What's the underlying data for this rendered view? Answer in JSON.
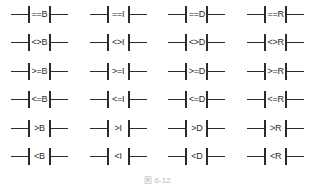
{
  "figure": {
    "caption": "图 6-12",
    "caption_visible": "partially clipped at bottom edge",
    "line_color": "#2b2b2b",
    "background_color": "#ffffff",
    "text_color": "#2b2b2b",
    "caption_color": "#b9b9b9"
  },
  "grid": {
    "columns": 4,
    "rows": 6,
    "column_suffixes": [
      "B",
      "I",
      "D",
      "R"
    ],
    "row_operators": [
      "==",
      "<>",
      ">=",
      "<=",
      ">",
      "<"
    ],
    "cells": [
      {
        "operator": "==",
        "suffix": "B",
        "label": "==B"
      },
      {
        "operator": "==",
        "suffix": "I",
        "label": "==I"
      },
      {
        "operator": "==",
        "suffix": "D",
        "label": "==D"
      },
      {
        "operator": "==",
        "suffix": "R",
        "label": "==R"
      },
      {
        "operator": "<>",
        "suffix": "B",
        "label": "<>B"
      },
      {
        "operator": "<>",
        "suffix": "I",
        "label": "<>I"
      },
      {
        "operator": "<>",
        "suffix": "D",
        "label": "<>D"
      },
      {
        "operator": "<>",
        "suffix": "R",
        "label": "<>R"
      },
      {
        "operator": ">=",
        "suffix": "B",
        "label": ">=B"
      },
      {
        "operator": ">=",
        "suffix": "I",
        "label": ">=I"
      },
      {
        "operator": ">=",
        "suffix": "D",
        "label": ">=D"
      },
      {
        "operator": ">=",
        "suffix": "R",
        "label": ">=R"
      },
      {
        "operator": "<=",
        "suffix": "B",
        "label": "<=B"
      },
      {
        "operator": "<=",
        "suffix": "I",
        "label": "<=I"
      },
      {
        "operator": "<=",
        "suffix": "D",
        "label": "<=D"
      },
      {
        "operator": "<=",
        "suffix": "R",
        "label": "<=R"
      },
      {
        "operator": ">",
        "suffix": "B",
        "label": ">B"
      },
      {
        "operator": ">",
        "suffix": "I",
        "label": ">I"
      },
      {
        "operator": ">",
        "suffix": "D",
        "label": ">D"
      },
      {
        "operator": ">",
        "suffix": "R",
        "label": ">R"
      },
      {
        "operator": "<",
        "suffix": "B",
        "label": "<B"
      },
      {
        "operator": "<",
        "suffix": "I",
        "label": "<I"
      },
      {
        "operator": "<",
        "suffix": "D",
        "label": "<D"
      },
      {
        "operator": "<",
        "suffix": "R",
        "label": "<R"
      }
    ]
  }
}
